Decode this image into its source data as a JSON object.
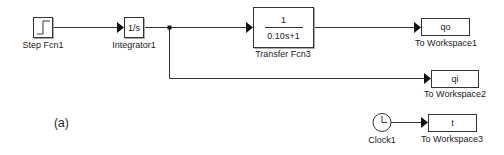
{
  "diagram": {
    "figure_label": "(a)",
    "blocks": {
      "step": {
        "label": "Step Fcn1",
        "icon": "step-icon"
      },
      "integrator": {
        "label": "Integrator1",
        "content": "1/s"
      },
      "transfer_fcn": {
        "label": "Transfer Fcn3",
        "numerator": "1",
        "denominator": "0.10s+1"
      },
      "to_workspace1": {
        "label": "To Workspace1",
        "variable": "qo"
      },
      "to_workspace2": {
        "label": "To Workspace2",
        "variable": "qi"
      },
      "clock": {
        "label": "Clock1",
        "icon": "clock-icon"
      },
      "to_workspace3": {
        "label": "To Workspace3",
        "variable": "t"
      }
    },
    "connections": [
      {
        "from": "Step Fcn1",
        "to": "Integrator1"
      },
      {
        "from": "Integrator1",
        "to": "Transfer Fcn3"
      },
      {
        "from": "Integrator1",
        "to": "To Workspace2",
        "via": "branch"
      },
      {
        "from": "Transfer Fcn3",
        "to": "To Workspace1"
      },
      {
        "from": "Clock1",
        "to": "To Workspace3"
      }
    ],
    "colors": {
      "line": "#333333",
      "block_border": "#333333",
      "background": "#ffffff"
    }
  }
}
